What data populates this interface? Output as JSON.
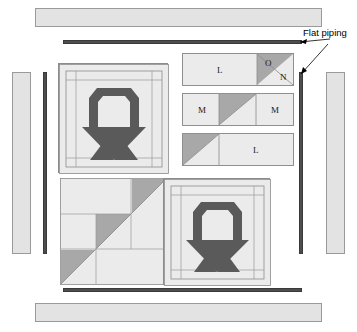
{
  "diagram": {
    "annotations": [
      {
        "id": "flat-piping",
        "label": "Flat piping",
        "x": 303,
        "y": 33
      }
    ],
    "colors": {
      "background": "#ffffff",
      "fabric_light": "#ebebeb",
      "fabric_border": "#e3e3e3",
      "fabric_medium": "#a8a8a8",
      "fabric_dark": "#5a5a5a",
      "piping": "#4d4d4d",
      "outline": "#8c8c8c",
      "text": "#000000"
    },
    "borders": [
      {
        "name": "top-border-strip",
        "label": "",
        "x": 35,
        "y": 8,
        "w": 287,
        "h": 19
      },
      {
        "name": "bottom-border-strip",
        "label": "",
        "x": 35,
        "y": 303,
        "w": 287,
        "h": 19
      },
      {
        "name": "left-border-strip",
        "label": "",
        "x": 12,
        "y": 72,
        "w": 19,
        "h": 182
      },
      {
        "name": "right-border-strip",
        "label": "",
        "x": 326,
        "y": 72,
        "w": 19,
        "h": 182
      }
    ],
    "pipings": [
      {
        "name": "top-piping",
        "x": 63,
        "y": 40,
        "w": 239,
        "h": 4
      },
      {
        "name": "bottom-piping",
        "x": 63,
        "y": 288,
        "w": 239,
        "h": 4
      },
      {
        "name": "left-piping",
        "x": 43,
        "y": 72,
        "w": 4,
        "h": 182
      },
      {
        "name": "right-piping",
        "x": 299,
        "y": 72,
        "w": 4,
        "h": 182
      }
    ],
    "blocks": [
      {
        "name": "basket-block-top-left",
        "kind": "basket",
        "x": 58,
        "y": 63,
        "w": 110,
        "h": 110
      },
      {
        "name": "pieced-block-bottom-left",
        "kind": "pieced",
        "x": 60,
        "y": 178,
        "w": 107,
        "h": 107
      },
      {
        "name": "basket-block-bottom-right",
        "kind": "basket",
        "x": 163,
        "y": 178,
        "w": 107,
        "h": 107
      }
    ],
    "unit_strips": [
      {
        "name": "strip-l-o-n",
        "x": 182,
        "y": 53,
        "w": 112,
        "h": 33,
        "cells": [
          {
            "name": "unit-l",
            "label": "L",
            "type": "rect",
            "x": 0,
            "w": 75,
            "shade": "light"
          },
          {
            "name": "unit-o-n",
            "label_a": "O",
            "label_b": "N",
            "type": "hst-tl",
            "x": 75,
            "w": 37,
            "shade_a": "medium",
            "shade_b": "light"
          }
        ]
      },
      {
        "name": "strip-m-hst-m",
        "x": 182,
        "y": 93,
        "w": 112,
        "h": 33,
        "cells": [
          {
            "name": "unit-m-left",
            "label": "M",
            "type": "rect",
            "x": 0,
            "w": 37,
            "shade": "light"
          },
          {
            "name": "unit-hst",
            "label": "",
            "type": "hst-tl",
            "x": 37,
            "w": 37,
            "shade_a": "medium",
            "shade_b": "light"
          },
          {
            "name": "unit-m-right",
            "label": "M",
            "type": "rect",
            "x": 74,
            "w": 38,
            "shade": "light"
          }
        ]
      },
      {
        "name": "strip-hst-l",
        "x": 182,
        "y": 133,
        "w": 112,
        "h": 33,
        "cells": [
          {
            "name": "unit-hst-left",
            "label": "",
            "type": "hst-tl",
            "x": 0,
            "w": 37,
            "shade_a": "medium",
            "shade_b": "light"
          },
          {
            "name": "unit-l-right",
            "label": "L",
            "type": "rect",
            "x": 37,
            "w": 75,
            "shade": "light"
          }
        ]
      }
    ]
  }
}
